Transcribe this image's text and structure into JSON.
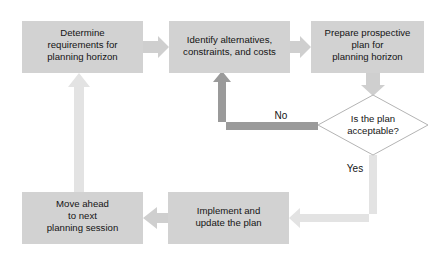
{
  "diagram": {
    "colors": {
      "box_fill": "#d2d2d2",
      "arrow_light": "#cfcfcf",
      "arrow_dark": "#9a9a9a",
      "diamond_fill": "#ffffff",
      "diamond_stroke": "#b4b4b4",
      "text": "#141414",
      "background": "#ffffff"
    },
    "nodes": [
      {
        "id": "determine-requirements",
        "shape": "process",
        "lines": [
          "Determine",
          "requirements for",
          "planning horizon"
        ],
        "x": 22,
        "y": 21,
        "w": 121,
        "h": 52
      },
      {
        "id": "identify-alternatives",
        "shape": "process",
        "lines": [
          "Identify alternatives,",
          "constraints, and costs"
        ],
        "x": 169,
        "y": 21,
        "w": 121,
        "h": 52
      },
      {
        "id": "prepare-plan",
        "shape": "process",
        "lines": [
          "Prepare prospective",
          "plan for",
          "planning horizon"
        ],
        "x": 311,
        "y": 21,
        "w": 113,
        "h": 52
      },
      {
        "id": "plan-acceptable-decision",
        "shape": "decision",
        "lines": [
          "Is the plan",
          "acceptable?"
        ],
        "cx": 373,
        "cy": 125,
        "rx": 55,
        "ry": 30
      },
      {
        "id": "implement-update",
        "shape": "process",
        "lines": [
          "Implement and",
          "update the plan"
        ],
        "x": 168,
        "y": 192,
        "w": 121,
        "h": 52
      },
      {
        "id": "move-ahead",
        "shape": "process",
        "lines": [
          "Move ahead",
          "to next",
          "planning session"
        ],
        "x": 22,
        "y": 192,
        "w": 121,
        "h": 52
      }
    ],
    "edge_labels": [
      {
        "id": "no-label",
        "text": "No",
        "x": 281,
        "y": 119
      },
      {
        "id": "yes-label",
        "text": "Yes",
        "x": 355,
        "y": 172
      }
    ]
  }
}
